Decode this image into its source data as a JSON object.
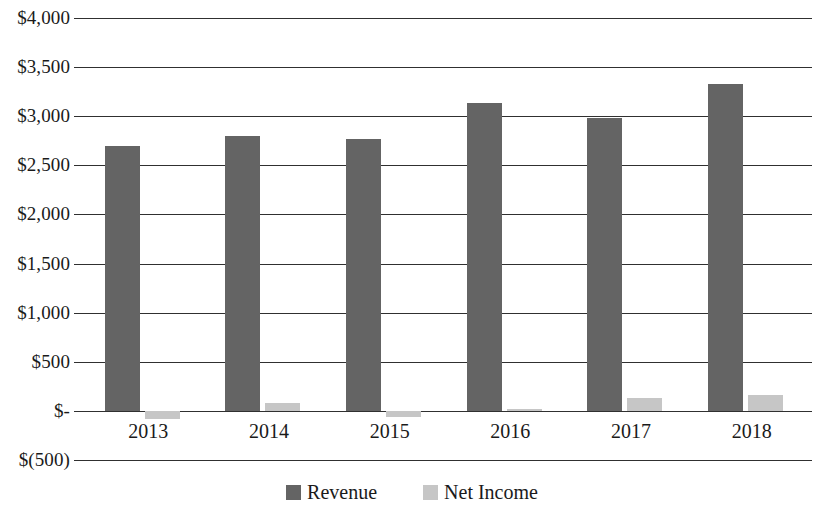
{
  "chart_data": {
    "type": "bar",
    "title": "",
    "subtitle": "",
    "xlabel": "",
    "ylabel": "",
    "categories": [
      "2013",
      "2014",
      "2015",
      "2016",
      "2017",
      "2018"
    ],
    "series": [
      {
        "name": "Revenue",
        "color": "#646464",
        "values": [
          2700,
          2800,
          2770,
          3130,
          2980,
          3330
        ]
      },
      {
        "name": "Net Income",
        "color": "#c6c6c6",
        "values": [
          -85,
          85,
          -60,
          15,
          130,
          160
        ]
      }
    ],
    "ylim": [
      -500,
      4000
    ],
    "ytick_values": [
      4000,
      3500,
      3000,
      2500,
      2000,
      1500,
      1000,
      500,
      0,
      -500
    ],
    "ytick_labels": [
      "$4,000",
      "$3,500",
      "$3,000",
      "$2,500",
      "$2,000",
      "$1,500",
      "$1,000",
      "$500",
      "$-",
      "$(500)"
    ],
    "grid": true,
    "legend_position": "bottom",
    "legend": [
      {
        "label": "Revenue",
        "swatch": "revenue"
      },
      {
        "label": "Net Income",
        "swatch": "netincome"
      }
    ]
  }
}
